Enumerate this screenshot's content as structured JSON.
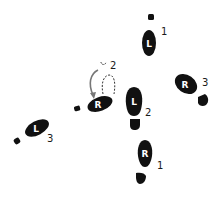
{
  "diagram": {
    "type": "dance-step-footprint-diagram",
    "colors": {
      "foot": "#111111",
      "letter": "#ffffff",
      "number": "#1a1a1a",
      "arrow": "#777777",
      "dashed": "#333333"
    },
    "footprints": [
      {
        "id": "left-1",
        "foot_letter": "L",
        "step": "1"
      },
      {
        "id": "right-1",
        "foot_letter": "R",
        "step": "1"
      },
      {
        "id": "left-2",
        "foot_letter": "L",
        "step": "2"
      },
      {
        "id": "right-2",
        "foot_letter": "R",
        "step": "2"
      },
      {
        "id": "right-3",
        "foot_letter": "R",
        "step": "3"
      },
      {
        "id": "left-3",
        "foot_letter": "L",
        "step": "3"
      }
    ]
  }
}
